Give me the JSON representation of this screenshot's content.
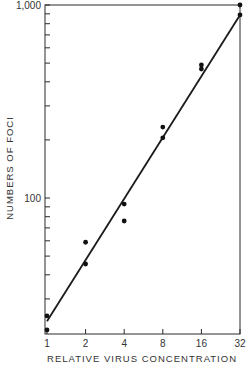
{
  "chart_data": {
    "type": "scatter",
    "title": "",
    "xlabel": "RELATIVE VIRUS CONCENTRATION",
    "ylabel": "NUMBERS OF FOCI",
    "xscale": "log2",
    "yscale": "log10",
    "xlim": [
      1,
      32
    ],
    "ylim": [
      20,
      1000
    ],
    "x_ticks": [
      1,
      2,
      4,
      8,
      16,
      32
    ],
    "x_tick_labels": [
      "1",
      "2",
      "4",
      "8",
      "16",
      "32"
    ],
    "y_ticks": [
      100,
      1000
    ],
    "y_tick_labels": [
      "100",
      "1,000"
    ],
    "grid": false,
    "legend": null,
    "series": [
      {
        "name": "observed foci",
        "style": "points",
        "points": [
          {
            "x": 1,
            "y": 24.5
          },
          {
            "x": 1,
            "y": 20.7
          },
          {
            "x": 2,
            "y": 59
          },
          {
            "x": 2,
            "y": 45.5
          },
          {
            "x": 4,
            "y": 93
          },
          {
            "x": 4,
            "y": 76
          },
          {
            "x": 8,
            "y": 233
          },
          {
            "x": 8,
            "y": 205
          },
          {
            "x": 16,
            "y": 489
          },
          {
            "x": 16,
            "y": 466
          },
          {
            "x": 32,
            "y": 1000
          },
          {
            "x": 32,
            "y": 888
          }
        ]
      },
      {
        "name": "fitted line",
        "style": "line",
        "points": [
          {
            "x": 1,
            "y": 23
          },
          {
            "x": 32,
            "y": 888
          }
        ]
      }
    ]
  },
  "labels": {
    "y_axis_title": "NUMBERS OF FOCI",
    "x_axis_title": "RELATIVE VIRUS CONCENTRATION",
    "y_tick_1000": "1,000",
    "y_tick_100": "100",
    "x_ticks": [
      "1",
      "2",
      "4",
      "8",
      "16",
      "32"
    ]
  }
}
